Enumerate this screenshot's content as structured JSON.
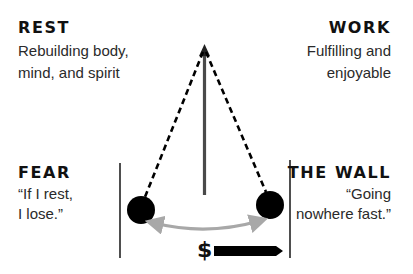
{
  "labels": {
    "rest": {
      "title": "REST",
      "line1": "Rebuilding body,",
      "line2": "mind, and spirit"
    },
    "work": {
      "title": "WORK",
      "line1": "Fulfilling and",
      "line2": "enjoyable"
    },
    "fear": {
      "title": "FEAR",
      "line1": "“If I rest,",
      "line2": "I lose.”"
    },
    "wall": {
      "title": "THE WALL",
      "line1": "“Going",
      "line2": "nowhere fast.”"
    }
  },
  "money": {
    "symbol": "$"
  },
  "colors": {
    "text": "#111111",
    "balls": "#000000",
    "center_axis": "#4a4a4a",
    "swing_arc": "#a8a8a8",
    "dashed_strings": "#000000",
    "boundary_lines": "#222222",
    "money_bar": "#000000"
  },
  "icons": {
    "pendulum_pivot_arrow": "arrow-up",
    "swing_arc": "double-headed-curved-arrow",
    "money_arrow": "arrow-right"
  }
}
